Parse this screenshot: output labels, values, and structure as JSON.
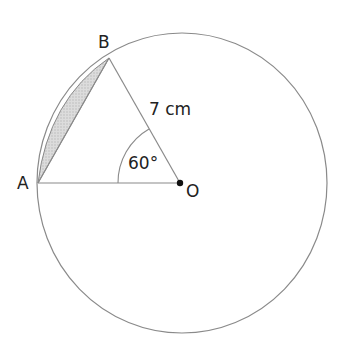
{
  "diagram": {
    "points": {
      "A": "A",
      "B": "B",
      "O": "O"
    },
    "radius_label": "7 cm",
    "angle_label": "60°",
    "colors": {
      "stroke": "#888888",
      "shade": "#cfcfcf",
      "text": "#222222"
    }
  }
}
